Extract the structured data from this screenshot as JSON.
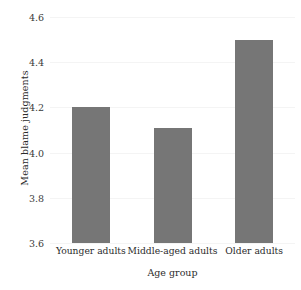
{
  "chart_data": {
    "type": "bar",
    "title": "",
    "subtitle": "",
    "xlabel": "Age group",
    "ylabel": "Mean blame judgments",
    "categories": [
      "Younger adults",
      "Middle-aged adults",
      "Older adults"
    ],
    "values": [
      4.2,
      4.11,
      4.5
    ],
    "ylim": [
      3.6,
      4.6
    ],
    "yticks": [
      "3.6",
      "3.8",
      "4.0",
      "4.2",
      "4.4",
      "4.6"
    ],
    "ytick_values": [
      3.6,
      3.8,
      4.0,
      4.2,
      4.4,
      4.6
    ],
    "grid": true,
    "legend": "none",
    "bar_color": "#767676",
    "background_color": "#ffffff",
    "text_color": "#2b2b2b",
    "gridline_color": "#f4f4f4"
  },
  "axes": {
    "y_title": "Mean blame judgments",
    "x_title": "Age group",
    "y_tick_labels": [
      "4.6",
      "4.4",
      "4.2",
      "4.0",
      "3.8",
      "3.6"
    ],
    "x_tick_labels": [
      "Younger adults",
      "Middle-aged adults",
      "Older adults"
    ]
  }
}
